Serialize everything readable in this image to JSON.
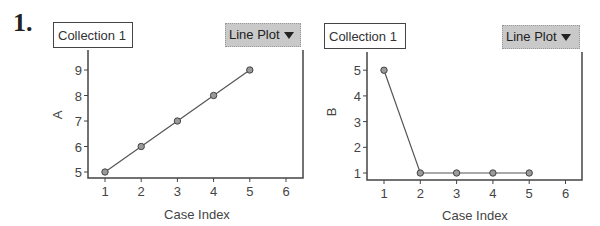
{
  "problem_number": "1.",
  "panels": [
    {
      "collection_label": "Collection 1",
      "plot_type_button": "Line Plot",
      "ylabel": "A",
      "xlabel": "Case Index"
    },
    {
      "collection_label": "Collection 1",
      "plot_type_button": "Line Plot",
      "ylabel": "B",
      "xlabel": "Case Index"
    }
  ],
  "chart_data": [
    {
      "type": "line",
      "title": "",
      "xlabel": "Case Index",
      "ylabel": "A",
      "x": [
        1,
        2,
        3,
        4,
        5
      ],
      "values": [
        5,
        6,
        7,
        8,
        9
      ],
      "xticks": [
        1,
        2,
        3,
        4,
        5,
        6
      ],
      "yticks": [
        5,
        6,
        7,
        8,
        9
      ],
      "xlim": [
        0.5,
        6.5
      ],
      "ylim": [
        4.75,
        9.75
      ],
      "grid": false,
      "markers": "circle"
    },
    {
      "type": "line",
      "title": "",
      "xlabel": "Case Index",
      "ylabel": "B",
      "x": [
        1,
        2,
        3,
        4,
        5
      ],
      "values": [
        5,
        1,
        1,
        1,
        1
      ],
      "xticks": [
        1,
        2,
        3,
        4,
        5,
        6
      ],
      "yticks": [
        1,
        2,
        3,
        4,
        5
      ],
      "xlim": [
        0.5,
        6.5
      ],
      "ylim": [
        0.75,
        5.75
      ],
      "grid": false,
      "markers": "circle"
    }
  ],
  "colors": {
    "line": "#555555",
    "marker_fill": "#9a9a9a",
    "button_bg": "#c9c9c9",
    "axis": "#444444"
  }
}
